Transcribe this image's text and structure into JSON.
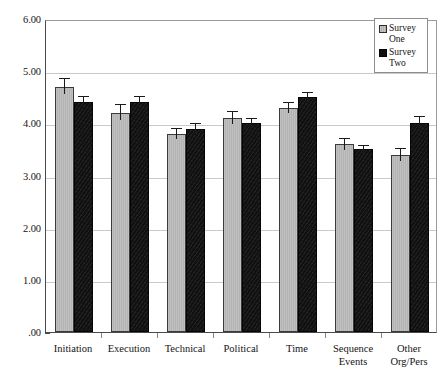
{
  "chart_data": {
    "type": "bar",
    "title": "",
    "xlabel": "",
    "ylabel": "",
    "ylim": [
      0,
      6
    ],
    "grid": true,
    "legend_position": "top-right",
    "categories": [
      "Initiation",
      "Execution",
      "Technical",
      "Political",
      "Time",
      "Sequence Events",
      "Other Org/Pers"
    ],
    "category_lines": [
      [
        "Initiation",
        ""
      ],
      [
        "Execution",
        ""
      ],
      [
        "Technical",
        ""
      ],
      [
        "Political",
        ""
      ],
      [
        "Time",
        ""
      ],
      [
        "Sequence",
        "Events"
      ],
      [
        "Other",
        "Org/Pers"
      ]
    ],
    "ytick_labels": [
      "6.00",
      "5.00",
      "4.00",
      "3.00",
      "2.00",
      "1.00",
      ".00"
    ],
    "ytick_values": [
      6,
      5,
      4,
      3,
      2,
      1,
      0
    ],
    "series": [
      {
        "name": "Survey One",
        "name_lines": [
          "Survey",
          "One"
        ],
        "color": "#b9b9b9",
        "values": [
          4.7,
          4.2,
          3.8,
          4.1,
          4.3,
          3.6,
          3.4
        ],
        "errors": [
          0.2,
          0.2,
          0.15,
          0.17,
          0.15,
          0.15,
          0.17
        ]
      },
      {
        "name": "Survey Two",
        "name_lines": [
          "Survey",
          "Two"
        ],
        "color": "#131313",
        "values": [
          4.4,
          4.4,
          3.9,
          4.0,
          4.5,
          3.5,
          4.0
        ],
        "errors": [
          0.17,
          0.17,
          0.15,
          0.15,
          0.13,
          0.13,
          0.18
        ]
      }
    ]
  },
  "legend": {
    "items": [
      {
        "label": "Survey One",
        "line1": "Survey",
        "line2": "One",
        "swatch": "series-one"
      },
      {
        "label": "Survey Two",
        "line1": "Survey",
        "line2": "Two",
        "swatch": "series-two"
      }
    ]
  }
}
